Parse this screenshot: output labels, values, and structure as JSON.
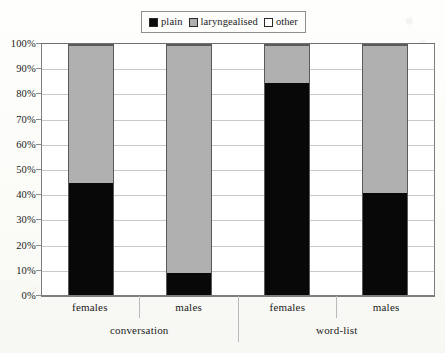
{
  "chart_data": {
    "type": "bar",
    "subtype": "100% stacked column",
    "title": "",
    "xlabel": "",
    "ylabel": "",
    "ylim": [
      0,
      100
    ],
    "ytick_labels": [
      "0%",
      "10%",
      "20%",
      "30%",
      "40%",
      "50%",
      "60%",
      "70%",
      "80%",
      "90%",
      "100%"
    ],
    "ytick_values": [
      0,
      10,
      20,
      30,
      40,
      50,
      60,
      70,
      80,
      90,
      100
    ],
    "grid": true,
    "legend_position": "top-center",
    "categories": [
      "females",
      "males",
      "females",
      "males"
    ],
    "group_labels": [
      "conversation",
      "word-list"
    ],
    "group_spans": [
      2,
      2
    ],
    "series": [
      {
        "name": "plain",
        "color": "#080808",
        "values": [
          45,
          9,
          85,
          41
        ]
      },
      {
        "name": "laryngealised",
        "color": "#b0b0b0",
        "values": [
          55,
          91,
          15,
          59
        ]
      },
      {
        "name": "other",
        "color": "#ffffff",
        "values": [
          0,
          0,
          0,
          0
        ]
      }
    ]
  },
  "legend": {
    "items": [
      {
        "label": "plain",
        "swatch": "black-square-icon"
      },
      {
        "label": "laryngealised",
        "swatch": "gray-square-icon"
      },
      {
        "label": "other",
        "swatch": "white-square-icon"
      }
    ]
  },
  "axes": {
    "y": {
      "ticks": [
        {
          "label": "100%",
          "value": 100
        },
        {
          "label": "90%",
          "value": 90
        },
        {
          "label": "80%",
          "value": 80
        },
        {
          "label": "70%",
          "value": 70
        },
        {
          "label": "60%",
          "value": 60
        },
        {
          "label": "50%",
          "value": 50
        },
        {
          "label": "40%",
          "value": 40
        },
        {
          "label": "30%",
          "value": 30
        },
        {
          "label": "20%",
          "value": 20
        },
        {
          "label": "10%",
          "value": 10
        },
        {
          "label": "0%",
          "value": 0
        }
      ]
    },
    "x": {
      "level1": [
        "females",
        "males",
        "females",
        "males"
      ],
      "level2": [
        "conversation",
        "word-list"
      ]
    }
  },
  "bars": [
    {
      "id": "conversation-females",
      "plain": 45,
      "laryngealised": 55,
      "other": 0
    },
    {
      "id": "conversation-males",
      "plain": 9,
      "laryngealised": 91,
      "other": 0
    },
    {
      "id": "wordlist-females",
      "plain": 85,
      "laryngealised": 15,
      "other": 0
    },
    {
      "id": "wordlist-males",
      "plain": 41,
      "laryngealised": 59,
      "other": 0
    }
  ]
}
